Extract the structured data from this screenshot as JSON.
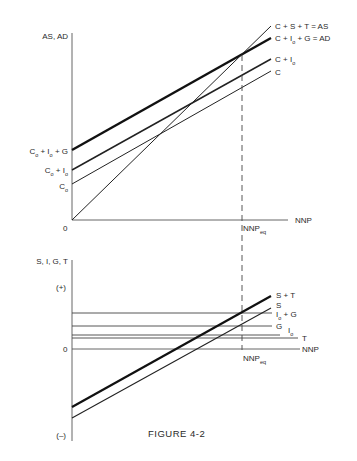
{
  "figure": {
    "caption": "FIGURE 4-2"
  },
  "top_panel": {
    "y_axis_label": "AS, AD",
    "x_axis_label": "NNP",
    "origin_label": "0",
    "equilibrium_label": "NNP",
    "equilibrium_sub": "eq",
    "curve_labels": {
      "as": {
        "main": "C + S + T = AS"
      },
      "ad": {
        "p1": "C + I",
        "sub": "o",
        "p2": " + G = AD"
      },
      "c_io": {
        "p1": "C + I",
        "sub": "o"
      },
      "c": {
        "main": "C"
      }
    },
    "intercept_labels": {
      "ad": {
        "a": "C",
        "asub": "o",
        "b": " + I",
        "bsub": "o",
        "c": " + G"
      },
      "c_io": {
        "a": "C",
        "asub": "o",
        "b": " + I",
        "bsub": "o"
      },
      "c": {
        "a": "C",
        "asub": "o"
      }
    }
  },
  "bottom_panel": {
    "y_axis_label": "S, I, G, T",
    "plus_label": "(+)",
    "minus_label": "(–)",
    "zero_label": "0",
    "x_axis_label": "NNP",
    "equilibrium_label": "NNP",
    "equilibrium_sub": "eq",
    "curve_labels": {
      "s_t": {
        "main": "S + T"
      },
      "s": {
        "main": "S"
      },
      "io_g": {
        "p1": "I",
        "sub": "o",
        "p2": " + G"
      },
      "g": {
        "main": "G"
      },
      "io": {
        "p1": "I",
        "sub": "o"
      },
      "t": {
        "main": "T"
      }
    }
  },
  "colors": {
    "ink": "#222222",
    "background": "#ffffff"
  }
}
